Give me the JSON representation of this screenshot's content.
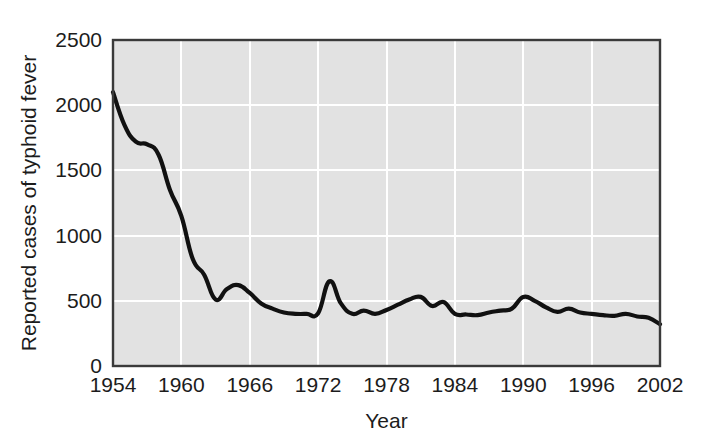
{
  "chart_data": {
    "type": "line",
    "title": "",
    "xlabel": "Year",
    "ylabel": "Reported cases of typhoid fever",
    "xlim": [
      1954,
      2002
    ],
    "ylim": [
      0,
      2500
    ],
    "grid": true,
    "legend": "none",
    "x_ticks": [
      1954,
      1960,
      1966,
      1972,
      1978,
      1984,
      1990,
      1996,
      2002
    ],
    "y_ticks": [
      0,
      500,
      1000,
      1500,
      2000,
      2500
    ],
    "x_tick_labels": [
      "1954",
      "1960",
      "1966",
      "1972",
      "1978",
      "1984",
      "1990",
      "1996",
      "2002"
    ],
    "y_tick_labels": [
      "0",
      "500",
      "1000",
      "1500",
      "2000",
      "2500"
    ],
    "series": [
      {
        "name": "Reported cases of typhoid fever",
        "color": "#111111",
        "x": [
          1954,
          1955,
          1956,
          1957,
          1958,
          1959,
          1960,
          1961,
          1962,
          1963,
          1964,
          1965,
          1966,
          1967,
          1968,
          1969,
          1970,
          1971,
          1972,
          1973,
          1974,
          1975,
          1976,
          1977,
          1978,
          1979,
          1980,
          1981,
          1982,
          1983,
          1984,
          1985,
          1986,
          1987,
          1988,
          1989,
          1990,
          1991,
          1992,
          1993,
          1994,
          1995,
          1996,
          1997,
          1998,
          1999,
          2000,
          2001,
          2002
        ],
        "values": [
          2100,
          1850,
          1720,
          1700,
          1620,
          1350,
          1150,
          820,
          700,
          510,
          590,
          620,
          560,
          480,
          440,
          410,
          400,
          400,
          405,
          650,
          480,
          400,
          425,
          400,
          430,
          470,
          510,
          530,
          460,
          490,
          400,
          395,
          390,
          410,
          425,
          440,
          530,
          500,
          450,
          415,
          440,
          410,
          400,
          390,
          385,
          400,
          380,
          370,
          320
        ]
      }
    ]
  },
  "axis": {
    "x_title": "Year",
    "y_title": "Reported cases of typhoid fever"
  }
}
